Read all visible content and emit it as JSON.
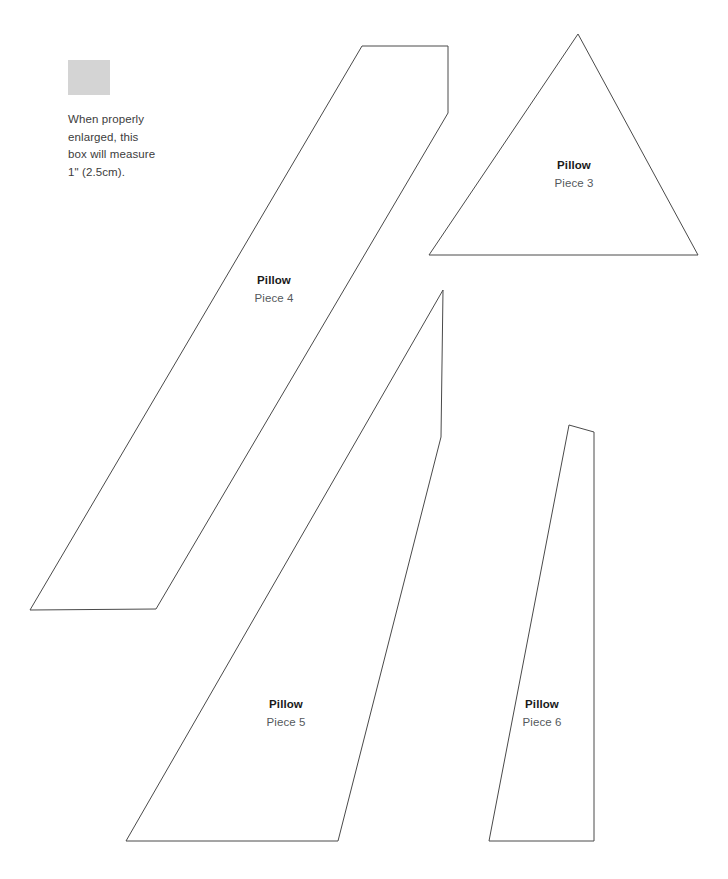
{
  "page": {
    "width": 728,
    "height": 879,
    "background": "#ffffff",
    "line_color": "#4a4a4a"
  },
  "scale_reference": {
    "box_color": "#d4d4d4",
    "box_width_px": 42,
    "box_height_px": 35,
    "caption_line1": "When properly",
    "caption_line2": "enlarged, this",
    "caption_line3": "box will measure",
    "caption_line4": "1\" (2.5cm)."
  },
  "pieces": [
    {
      "id": "piece-4",
      "title": "Pillow",
      "subtitle": "Piece 4",
      "label_x": 274,
      "label_y": 272,
      "points": "362,46 448,46 448,113 156,609 30,610"
    },
    {
      "id": "piece-3",
      "title": "Pillow",
      "subtitle": "Piece 3",
      "label_x": 574,
      "label_y": 157,
      "points": "578,34 698,255 429,255"
    },
    {
      "id": "piece-5",
      "title": "Pillow",
      "subtitle": "Piece 5",
      "label_x": 286,
      "label_y": 696,
      "points": "443,290 441,437 338,841 126,841"
    },
    {
      "id": "piece-6",
      "title": "Pillow",
      "subtitle": "Piece 6",
      "label_x": 542,
      "label_y": 696,
      "points": "569,425 594,432 594,841 489,841"
    }
  ]
}
